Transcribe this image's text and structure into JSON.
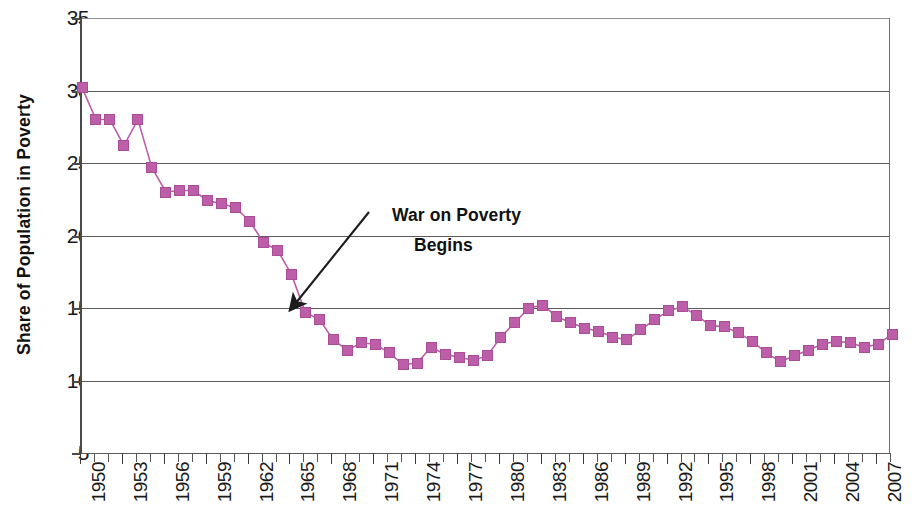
{
  "chart_data": {
    "type": "line",
    "title": "",
    "xlabel": "",
    "ylabel": "Share of Population in Poverty",
    "ylim": [
      5,
      35
    ],
    "ytick_values": [
      35,
      30,
      25,
      20,
      15,
      10,
      5
    ],
    "ytick_labels": [
      "35",
      "30",
      "25",
      "20",
      "15",
      "10",
      "5"
    ],
    "xlim": [
      1950,
      2008
    ],
    "xtick_labels": [
      "1950",
      "1953",
      "1956",
      "1959",
      "1962",
      "1965",
      "1968",
      "1971",
      "1974",
      "1977",
      "1980",
      "1983",
      "1986",
      "1989",
      "1992",
      "1995",
      "1998",
      "2001",
      "2004",
      "2007"
    ],
    "grid": "horizontal",
    "legend": "none",
    "series_color": "#bd5fa8",
    "marker": "square",
    "x": [
      1950,
      1951,
      1952,
      1953,
      1954,
      1955,
      1956,
      1957,
      1958,
      1959,
      1960,
      1961,
      1962,
      1963,
      1964,
      1965,
      1966,
      1967,
      1968,
      1969,
      1970,
      1971,
      1972,
      1973,
      1974,
      1975,
      1976,
      1977,
      1978,
      1979,
      1980,
      1981,
      1982,
      1983,
      1984,
      1985,
      1986,
      1987,
      1988,
      1989,
      1990,
      1991,
      1992,
      1993,
      1994,
      1995,
      1996,
      1997,
      1998,
      1999,
      2000,
      2001,
      2002,
      2003,
      2004,
      2005,
      2006,
      2007,
      2008
    ],
    "values": [
      30.2,
      28.0,
      28.0,
      26.2,
      28.0,
      24.7,
      23.0,
      23.1,
      23.1,
      22.4,
      22.2,
      21.9,
      21.0,
      19.5,
      19.0,
      17.3,
      14.7,
      14.2,
      12.8,
      12.1,
      12.6,
      12.5,
      11.9,
      11.1,
      11.2,
      12.3,
      11.8,
      11.6,
      11.4,
      11.7,
      13.0,
      14.0,
      15.0,
      15.2,
      14.4,
      14.0,
      13.6,
      13.4,
      13.0,
      12.8,
      13.5,
      14.2,
      14.8,
      15.1,
      14.5,
      13.8,
      13.7,
      13.3,
      12.7,
      11.9,
      11.3,
      11.7,
      12.1,
      12.5,
      12.7,
      12.6,
      12.3,
      12.5,
      13.2
    ],
    "annotations": [
      {
        "text_line1": "War on Poverty",
        "text_line2": "Begins",
        "arrow_target_year": 1965,
        "arrow_target_value": 14.9
      }
    ]
  },
  "axis": {
    "y_title": "Share of Population in Poverty"
  }
}
